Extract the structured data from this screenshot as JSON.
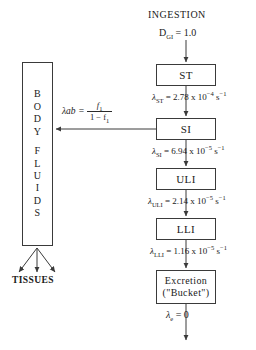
{
  "diagram": {
    "background": "#ffffff",
    "stroke": "#3a3a3a"
  },
  "header": {
    "ingestion": "INGESTION",
    "intake_symbol": "D",
    "intake_subscript": "GI",
    "intake_equals": "= 1.0"
  },
  "compartments": [
    {
      "id": "st",
      "label": "ST"
    },
    {
      "id": "si",
      "label": "SI"
    },
    {
      "id": "uli",
      "label": "ULI"
    },
    {
      "id": "lli",
      "label": "LLI"
    },
    {
      "id": "excretion",
      "label_line1": "Excretion",
      "label_line2": "(\"Bucket\")"
    }
  ],
  "body_fluids": {
    "word1": [
      "B",
      "O",
      "D",
      "Y"
    ],
    "word2": [
      "F",
      "L",
      "U",
      "I",
      "D",
      "S"
    ]
  },
  "tissues": {
    "label": "TISSUES"
  },
  "transfer_rates": [
    {
      "id": "st",
      "symbol": "λ",
      "subscript": "ST",
      "equals": "=",
      "mantissa": "2.78",
      "times": "x",
      "base": "10",
      "exponent": "−4",
      "unit_base": "s",
      "unit_exponent": "−1"
    },
    {
      "id": "si",
      "symbol": "λ",
      "subscript": "SI",
      "equals": "=",
      "mantissa": "6.94",
      "times": "x",
      "base": "10",
      "exponent": "−5",
      "unit_base": "s",
      "unit_exponent": "−1"
    },
    {
      "id": "uli",
      "symbol": "λ",
      "subscript": "ULI",
      "equals": "=",
      "mantissa": "2.14",
      "times": "x",
      "base": "10",
      "exponent": "−5",
      "unit_base": "s",
      "unit_exponent": "−1"
    },
    {
      "id": "lli",
      "symbol": "λ",
      "subscript": "LLI",
      "equals": "=",
      "mantissa": "1.16",
      "times": "x",
      "base": "10",
      "exponent": "−5",
      "unit_base": "s",
      "unit_exponent": "−1"
    },
    {
      "id": "e",
      "symbol": "λ",
      "subscript": "e",
      "equals": "= 0"
    }
  ],
  "absorption": {
    "symbol": "λab",
    "equals": "=",
    "numerator": "f",
    "numerator_subscript": "1",
    "denominator_lead": "1 −  f",
    "denominator_subscript": "1"
  }
}
